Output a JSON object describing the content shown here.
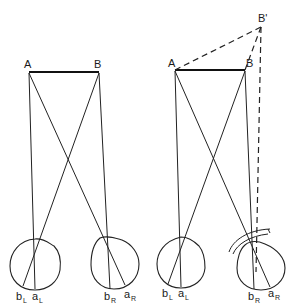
{
  "figure": {
    "left_panel": {
      "point_A": "A",
      "point_B": "B",
      "left_eye": {
        "label_b": "b",
        "label_b_sub": "L",
        "label_a": "a",
        "label_a_sub": "L"
      },
      "right_eye": {
        "label_b": "b",
        "label_b_sub": "R",
        "label_a": "a",
        "label_a_sub": "R"
      }
    },
    "right_panel": {
      "point_A": "A",
      "point_B": "B",
      "point_B_prime": "B'",
      "left_eye": {
        "label_b": "b",
        "label_b_sub": "L",
        "label_a": "a",
        "label_a_sub": "L"
      },
      "right_eye": {
        "label_b": "b",
        "label_b_sub": "R",
        "label_a": "a",
        "label_a_sub": "R"
      },
      "prism": "prism-arc"
    }
  },
  "colors": {
    "line": "#222222",
    "background": "#ffffff"
  }
}
